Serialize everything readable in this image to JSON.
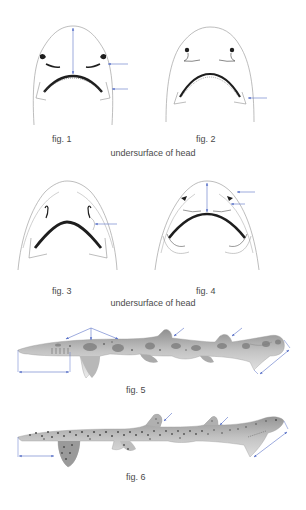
{
  "colors": {
    "arrow": "#5a72c8",
    "outline": "#9a9a9a",
    "mouth": "#1e1e1e",
    "body_light": "#d4d4d4",
    "body_dark": "#8a8a8a",
    "spot": "#5e5e5e"
  },
  "figures": [
    {
      "id": "fig1",
      "label": "fig. 1",
      "subject": "undersurface of head",
      "arrows": [
        "snout-to-mouth-length-double-arrow",
        "nostril-flap-arrow",
        "labial-furrow-arrow"
      ]
    },
    {
      "id": "fig2",
      "label": "fig. 2",
      "subject": "undersurface of head",
      "arrows": [
        "labial-furrow-arrow"
      ]
    },
    {
      "id": "fig3",
      "label": "fig. 3",
      "subject": "undersurface of head",
      "arrows": [
        "nostril-groove-arrow"
      ]
    },
    {
      "id": "fig4",
      "label": "fig. 4",
      "subject": "undersurface of head",
      "arrows": [
        "snout-length-double-arrow",
        "nostril-arrow",
        "nasal-flap-arrow"
      ]
    },
    {
      "id": "fig5",
      "label": "fig. 5",
      "subject": "lateral view of shark (saddle-blotched)",
      "arrows": [
        "saddle-blotches-arrows",
        "first-dorsal-fin-arrow",
        "second-dorsal-fin-arrow",
        "head-length-double-arrow",
        "caudal-fin-length-double-arrow"
      ]
    },
    {
      "id": "fig6",
      "label": "fig. 6",
      "subject": "lateral view of shark (densely spotted)",
      "arrows": [
        "first-dorsal-fin-arrow",
        "second-dorsal-fin-arrow",
        "head-length-double-arrow",
        "caudal-fin-length-double-arrow"
      ]
    }
  ],
  "captions": {
    "row1": "undersurface of head",
    "row2": "undersurface of head"
  }
}
